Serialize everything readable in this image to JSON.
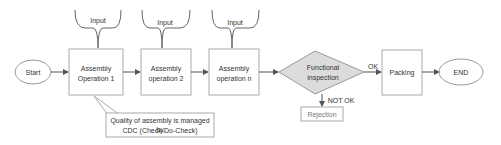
{
  "diagram": {
    "nodes": {
      "start": "Start",
      "op1_l1": "Assembly",
      "op1_l2": "Operation 1",
      "op2_l1": "Assembly",
      "op2_l2": "operation 2",
      "opn_l1": "Assembly",
      "opn_l2": "operation n",
      "inspect_l1": "Functional",
      "inspect_l2": "inspection",
      "packing": "Packing",
      "end": "END",
      "rejection": "Rejection"
    },
    "inputs": [
      "Input",
      "Input",
      "Input"
    ],
    "edge_labels": {
      "ok": "OK",
      "not_ok": "NOT OK"
    },
    "callout": {
      "line1": "Quality of assembly is managed by",
      "line2": "CDC (Check-Do-Check)"
    },
    "colors": {
      "stroke": "#9a9a9a",
      "decision_fill": "#dcdcdc",
      "arrow": "#555555"
    }
  }
}
